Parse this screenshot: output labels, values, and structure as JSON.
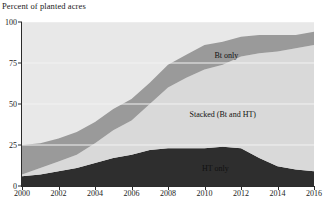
{
  "chart": {
    "ylabel": "Percent of planted acres",
    "ylabel_position": "top-left"
  },
  "chart_data": {
    "type": "area",
    "stacked": true,
    "title": "",
    "subtitle": "",
    "xlabel": "",
    "ylabel": "Percent of planted acres",
    "xlim": [
      2000,
      2016
    ],
    "ylim": [
      0,
      100
    ],
    "grid": true,
    "grid_axis": "y",
    "legend_position": "inline-labels",
    "x": [
      2000,
      2001,
      2002,
      2003,
      2004,
      2005,
      2006,
      2007,
      2008,
      2009,
      2010,
      2011,
      2012,
      2013,
      2014,
      2015,
      2016
    ],
    "xticks": [
      2000,
      2002,
      2004,
      2006,
      2008,
      2010,
      2012,
      2014,
      2016
    ],
    "xticklabels": [
      "2000",
      "2002",
      "2004",
      "2006",
      "2008",
      "2010",
      "2012",
      "2014",
      "2016"
    ],
    "yticks": [
      0,
      25,
      50,
      75,
      100
    ],
    "yticklabels": [
      "0",
      "25",
      "50",
      "75",
      "100"
    ],
    "series": [
      {
        "name": "HT only",
        "label": "HT only",
        "color": "#2e2e2e",
        "values": [
          6,
          7,
          9,
          11,
          14,
          17,
          19,
          22,
          23,
          23,
          23,
          24,
          23,
          17,
          12,
          10,
          9
        ]
      },
      {
        "name": "Stacked (Bt and HT)",
        "label": "Stacked (Bt and HT)",
        "color": "#d9d9d9",
        "values": [
          1,
          4,
          6,
          8,
          12,
          17,
          21,
          28,
          37,
          43,
          48,
          50,
          56,
          64,
          70,
          74,
          77
        ]
      },
      {
        "name": "Bt only",
        "label": "Bt only",
        "color": "#9a9a9a",
        "values": [
          18,
          15,
          14,
          14,
          13,
          13,
          13,
          13,
          14,
          14,
          15,
          14,
          12,
          11,
          10,
          8,
          8
        ]
      }
    ],
    "annotations": [
      {
        "text": "Bt only",
        "x": 2011.2,
        "y": 80
      },
      {
        "text": "Stacked (Bt and HT)",
        "x": 2011.0,
        "y": 44
      },
      {
        "text": "HT only",
        "x": 2010.6,
        "y": 11
      }
    ],
    "colors": {
      "ht_only": "#2e2e2e",
      "stacked": "#d9d9d9",
      "bt_only": "#9a9a9a",
      "plot_background": "#e8e8e8",
      "gridline": "#f2f2f2",
      "axis": "#2b2b2b",
      "text": "#1a1a1a"
    }
  }
}
